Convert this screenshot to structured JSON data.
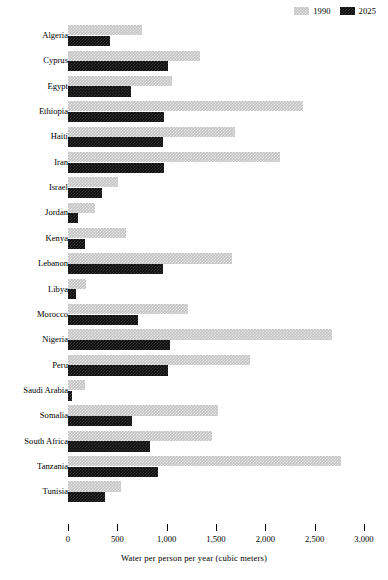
{
  "chart_data": {
    "type": "bar",
    "orientation": "horizontal",
    "title": "",
    "xlabel": "Water per person per year (cubic meters)",
    "ylabel": "",
    "xlim": [
      0,
      3000
    ],
    "xticks": [
      0,
      500,
      1000,
      1500,
      2000,
      2500,
      3000
    ],
    "xtick_labels": [
      "0",
      "500",
      "1,000",
      "1,500",
      "2,000",
      "2,500",
      "3,000"
    ],
    "grid": false,
    "legend_position": "top-right",
    "categories": [
      "Algeria",
      "Cyprus",
      "Egypt",
      "Ethiopia",
      "Haiti",
      "Iran",
      "Israel",
      "Jordan",
      "Kenya",
      "Lebanon",
      "Libya",
      "Morocco",
      "Nigeria",
      "Peru",
      "Saudi Arabia",
      "Somalia",
      "South Africa",
      "Tanzania",
      "Tunisia"
    ],
    "series": [
      {
        "name": "1990",
        "color": "#c3c3c3",
        "values": [
          750,
          1340,
          1055,
          2380,
          1690,
          2150,
          505,
          270,
          590,
          1660,
          180,
          1215,
          2675,
          1845,
          170,
          1520,
          1460,
          2765,
          535
        ]
      },
      {
        "name": "2025",
        "color": "#0d0d0d",
        "values": [
          425,
          1010,
          640,
          975,
          965,
          975,
          345,
          100,
          170,
          965,
          80,
          710,
          1035,
          1010,
          40,
          650,
          830,
          910,
          375
        ]
      }
    ]
  },
  "legend": {
    "entries": [
      {
        "label": "1990",
        "swatch": "legend-swatch-1990"
      },
      {
        "label": "2025",
        "swatch": "legend-swatch-2025"
      }
    ]
  }
}
